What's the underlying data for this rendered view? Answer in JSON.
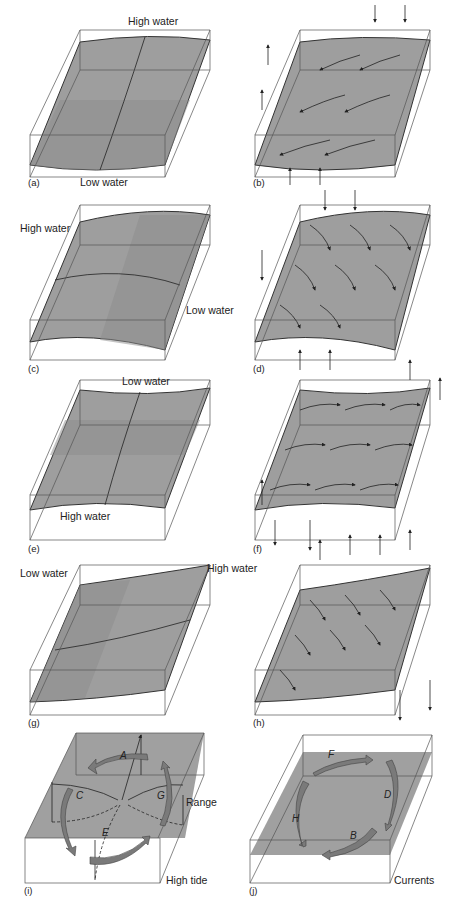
{
  "panels": {
    "a": {
      "tag": "(a)",
      "top_label": "High water",
      "bottom_label": "Low water"
    },
    "b": {
      "tag": "(b)"
    },
    "c": {
      "tag": "(c)",
      "left_label": "High water",
      "right_label": "Low water"
    },
    "d": {
      "tag": "(d)"
    },
    "e": {
      "tag": "(e)",
      "top_label": "Low water",
      "bottom_label": "High water"
    },
    "f": {
      "tag": "(f)"
    },
    "g": {
      "tag": "(g)",
      "left_label": "Low water",
      "right_label": "High water"
    },
    "h": {
      "tag": "(h)"
    },
    "i": {
      "tag": "(i)",
      "letters": [
        "A",
        "C",
        "G",
        "E"
      ],
      "range_label": "Range",
      "corner_label": "High tide"
    },
    "j": {
      "tag": "(j)",
      "letters": [
        "F",
        "D",
        "H",
        "B"
      ],
      "corner_label": "Currents"
    }
  }
}
